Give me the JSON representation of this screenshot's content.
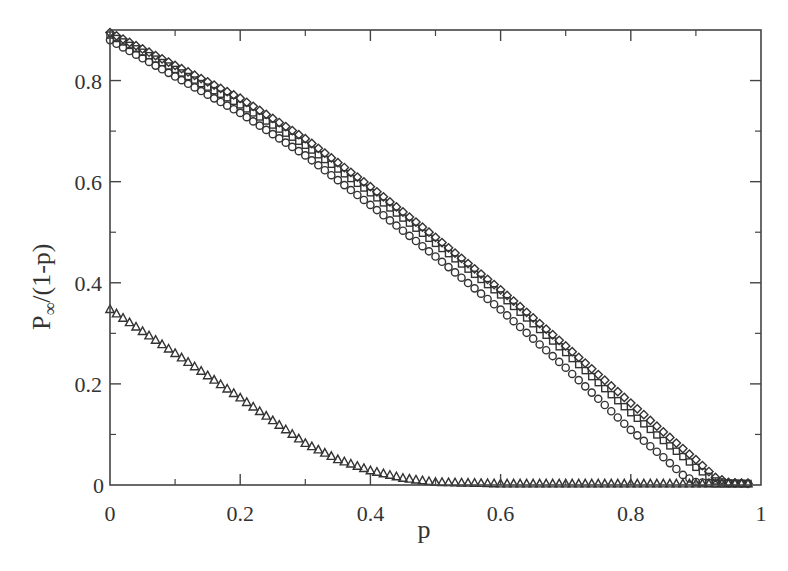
{
  "chart_data": {
    "type": "scatter",
    "title": "",
    "xlabel": "p",
    "ylabel": "P∞/(1-p)",
    "xlim": [
      0,
      1
    ],
    "ylim": [
      0,
      0.9
    ],
    "grid": false,
    "legend": null,
    "x_ticks": [
      0,
      0.2,
      0.4,
      0.6,
      0.8,
      1
    ],
    "x_tick_labels": [
      "0",
      "0.2",
      "0.4",
      "0.6",
      "0.8",
      "1"
    ],
    "x_minor_ticks": [
      0.1,
      0.3,
      0.5,
      0.7,
      0.9
    ],
    "y_ticks": [
      0,
      0.2,
      0.4,
      0.6,
      0.8
    ],
    "y_tick_labels": [
      "0",
      "0.2",
      "0.4",
      "0.6",
      "0.8"
    ],
    "y_minor_ticks": [
      0.1,
      0.3,
      0.5,
      0.7
    ],
    "series": [
      {
        "name": "diamonds",
        "marker": "diamond",
        "x": [
          0,
          0.1,
          0.2,
          0.3,
          0.4,
          0.5,
          0.6,
          0.7,
          0.8,
          0.85,
          0.9,
          0.93,
          0.95,
          0.98
        ],
        "y": [
          0.895,
          0.83,
          0.765,
          0.685,
          0.59,
          0.49,
          0.386,
          0.275,
          0.162,
          0.105,
          0.05,
          0.015,
          0.005,
          0.003
        ]
      },
      {
        "name": "squares",
        "marker": "square",
        "x": [
          0,
          0.1,
          0.2,
          0.3,
          0.4,
          0.5,
          0.6,
          0.7,
          0.8,
          0.85,
          0.9,
          0.93,
          0.95,
          0.98
        ],
        "y": [
          0.89,
          0.822,
          0.752,
          0.672,
          0.578,
          0.478,
          0.376,
          0.262,
          0.143,
          0.088,
          0.035,
          0.008,
          0.004,
          0.003
        ]
      },
      {
        "name": "circles",
        "marker": "circle",
        "x": [
          0,
          0.1,
          0.2,
          0.3,
          0.4,
          0.5,
          0.6,
          0.7,
          0.8,
          0.85,
          0.88,
          0.9,
          0.93,
          0.95,
          0.98
        ],
        "y": [
          0.88,
          0.808,
          0.736,
          0.652,
          0.554,
          0.452,
          0.347,
          0.232,
          0.109,
          0.055,
          0.02,
          0.006,
          0.003,
          0.003,
          0.003
        ]
      },
      {
        "name": "triangles",
        "marker": "triangle",
        "x": [
          0,
          0.1,
          0.2,
          0.3,
          0.35,
          0.4,
          0.45,
          0.5,
          0.6,
          0.7,
          0.8,
          0.9,
          0.98
        ],
        "y": [
          0.347,
          0.26,
          0.172,
          0.082,
          0.05,
          0.028,
          0.013,
          0.005,
          0.002,
          0.002,
          0.002,
          0.002,
          0.002
        ]
      }
    ]
  },
  "style": {
    "axis_color": "#444444",
    "marker_color": "#333333",
    "background": "#ffffff"
  }
}
